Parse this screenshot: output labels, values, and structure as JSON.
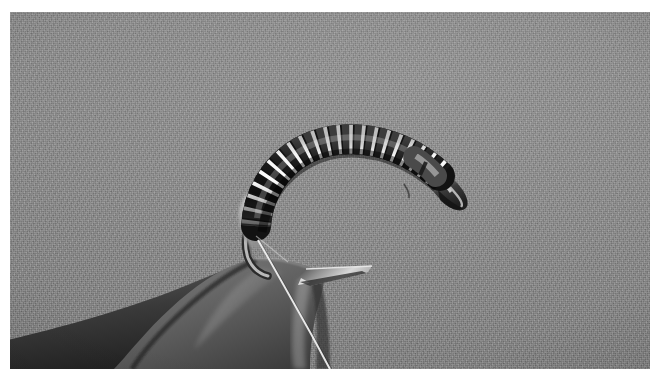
{
  "image": {
    "kind": "photograph",
    "subject": "fly-tying-vise-with-ribbed-midge-fly",
    "color_mode": "grayscale",
    "width_px": 660,
    "height_px": 371,
    "photo_area": {
      "left_px": 10,
      "top_px": 12,
      "width_px": 640,
      "height_px": 357
    },
    "background_color": "#8b8b8b",
    "border_color": "#ffffff"
  },
  "palette": {
    "backdrop_light": "#949494",
    "backdrop_mid": "#8b8b8b",
    "backdrop_dark": "#7e7e7e",
    "thread_black": "#1a1a1a",
    "rib_silver": "#e6e6e6",
    "rib_silver_shadow": "#9a9a9a",
    "hook_steel": "#c9c9c9",
    "vise_jaw_dark": "#2e2e2e",
    "vise_jaw_mid": "#6a6a6a",
    "vise_jaw_light": "#a8a8a8",
    "white_blur": "#f2f2f2",
    "gill_translucent": "#b9b9b9",
    "tying_thread": "#e8e8e8"
  },
  "subjects": {
    "fly_body": {
      "name": "ribbed midge body",
      "description": "black thread body with silver wire rib wrapped along a curved scud hook shank",
      "segment_count": 18,
      "arc": {
        "start_x": 243,
        "start_y": 230,
        "apex_x": 330,
        "apex_y": 128,
        "end_x": 432,
        "end_y": 160
      }
    },
    "hook": {
      "name": "curved scud hook",
      "bend_x": 240,
      "bend_y": 250,
      "point_tip_x": 360,
      "point_tip_y": 256,
      "head_x": 455,
      "head_y": 180
    },
    "vise_jaws": {
      "name": "fly tying vise jaws",
      "tip_x": 250,
      "tip_y": 262,
      "description": "dark tapered metal jaws entering from lower-left, gripping the hook"
    },
    "tying_thread": {
      "name": "hanging tying thread",
      "top_x": 254,
      "top_y": 240,
      "bottom_x": 320,
      "bottom_y": 369
    },
    "white_blur_object": {
      "name": "out-of-focus white material",
      "x": 60,
      "y": 350
    }
  },
  "labels": {
    "alt_text": "Black and white macro photo of a ribbed midge fly tied on a curved hook held in a fly-tying vise against a gray background"
  }
}
